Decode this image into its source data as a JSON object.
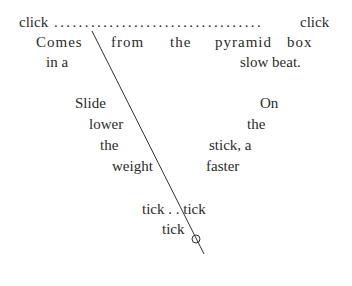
{
  "poem": {
    "top_line": {
      "left": "click",
      "dots": "..................................",
      "right": "click"
    },
    "row2": [
      "Comes",
      "from",
      "the",
      "pyramid",
      "box"
    ],
    "row3": {
      "left": "in a",
      "right": "slow beat."
    },
    "left_column": [
      "Slide",
      "lower",
      "the",
      "weight"
    ],
    "right_column": [
      "On",
      "the",
      "stick, a",
      "faster"
    ],
    "bottom": {
      "line1": "tick . . tick",
      "line2": "tick"
    }
  },
  "shape": {
    "name": "metronome-stick",
    "line_color": "#333333",
    "circle_color": "#333333"
  }
}
